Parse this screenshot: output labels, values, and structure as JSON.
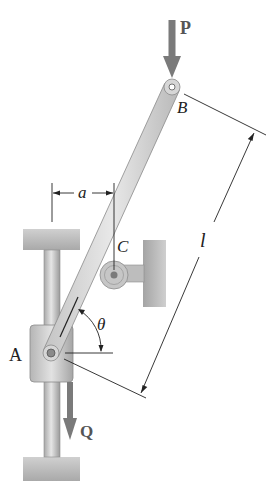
{
  "figure": {
    "labels": {
      "force_top": "P",
      "force_bottom": "Q",
      "point_top": "B",
      "point_roller": "C",
      "point_collar": "A",
      "dim_horizontal": "a",
      "dim_length": "l",
      "angle": "θ"
    },
    "colors": {
      "force_arrow": "#7a7a7a",
      "bar_fill": "#d9d9d9",
      "bar_stroke": "#8a8a8a",
      "support_fill": "#bdbdbd",
      "line": "#222222"
    }
  }
}
